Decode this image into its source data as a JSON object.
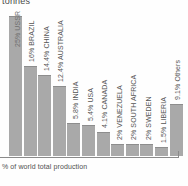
{
  "chart_data": {
    "type": "bar",
    "title": "tonnes",
    "xlabel": "% of world total production",
    "ylabel": "",
    "ylim": [
      0,
      25
    ],
    "grid": false,
    "legend": "none",
    "orientation": "vertical",
    "categories": [
      "USSR",
      "BRAZIL",
      "CHINA",
      "AUSTRALIA",
      "INDIA",
      "USA",
      "CANADA",
      "VENEZUELA",
      "SOUTH AFRICA",
      "SWEDEN",
      "LIBERIA",
      "Others"
    ],
    "values": [
      25,
      16,
      14.4,
      12.4,
      5.8,
      5.4,
      4.1,
      2,
      2,
      2,
      1.5,
      9.1
    ],
    "bar_labels": [
      "25% USSR",
      "16% BRAZIL",
      "14.4% CHINA",
      "12.4% AUSTRALIA",
      "5.8% INDIA",
      "5.4% USA",
      "4.1% CANADA",
      "2% VENEZUELA",
      "2% SOUTH AFRICA",
      "2% SWEDEN",
      "1.5% LIBERIA",
      "9.1% Others"
    ],
    "bar_color": "#a9a9a9",
    "axis_color": "#8a8a8a",
    "text_color": "#555555"
  }
}
